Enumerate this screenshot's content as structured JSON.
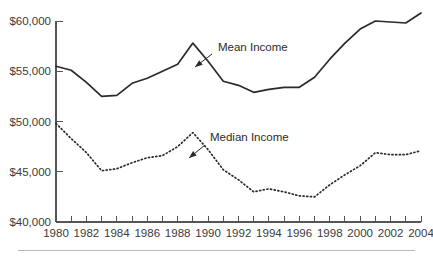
{
  "figure": {
    "name": "income-trend-chart",
    "background_color": "#ffffff",
    "line_color": "#2a2a2a",
    "axis_color": "#555555",
    "footer_rule_color": "#b9b9b9"
  },
  "chart_data": {
    "type": "line",
    "title": "",
    "subtitle": "",
    "xlabel": "",
    "ylabel": "",
    "xlim": [
      1980,
      2004
    ],
    "ylim": [
      40000,
      60000
    ],
    "grid": false,
    "legend_position": "inline-annotation",
    "x": [
      1980,
      1981,
      1982,
      1983,
      1984,
      1985,
      1986,
      1987,
      1988,
      1989,
      1990,
      1991,
      1992,
      1993,
      1994,
      1995,
      1996,
      1997,
      1998,
      1999,
      2000,
      2001,
      2002,
      2003,
      2004
    ],
    "x_tick_labels": [
      "1980",
      "",
      "1982",
      "",
      "1984",
      "",
      "1986",
      "",
      "1988",
      "",
      "1990",
      "",
      "1992",
      "",
      "1994",
      "",
      "1996",
      "",
      "1998",
      "",
      "2000",
      "",
      "2002",
      "",
      "2004"
    ],
    "y_tick_values": [
      40000,
      45000,
      50000,
      55000,
      60000
    ],
    "y_tick_labels": [
      "$40,000",
      "$45,000",
      "$50,000",
      "$55,000",
      "$60,000"
    ],
    "series": [
      {
        "name": "Mean Income",
        "style": "solid",
        "annotation": "Mean Income",
        "values": [
          55500,
          55100,
          53900,
          52500,
          52600,
          53800,
          54300,
          55000,
          55700,
          57800,
          56000,
          54000,
          53600,
          52900,
          53200,
          53400,
          53400,
          54400,
          56200,
          57800,
          59200,
          60000,
          59900,
          59800,
          60800
        ]
      },
      {
        "name": "Median Income",
        "style": "dotted",
        "annotation": "Median Income",
        "values": [
          49800,
          48300,
          46900,
          45100,
          45300,
          45900,
          46400,
          46600,
          47500,
          48900,
          47200,
          45200,
          44200,
          43000,
          43300,
          43000,
          42600,
          42500,
          43700,
          44700,
          45600,
          46900,
          46700,
          46700,
          47100
        ]
      }
    ],
    "annotations": [
      {
        "label": "Mean Income",
        "text_x": 218,
        "text_y": 51,
        "arrow_from_x": 212,
        "arrow_from_y": 54,
        "arrow_to_x": 195,
        "arrow_to_y": 67
      },
      {
        "label": "Median Income",
        "text_x": 210,
        "text_y": 141,
        "arrow_from_x": 205,
        "arrow_from_y": 145,
        "arrow_to_x": 189,
        "arrow_to_y": 158
      }
    ]
  },
  "axes": {
    "plot_left": 56,
    "plot_right": 421,
    "plot_top": 21,
    "plot_bottom": 222,
    "y_axis_label": "income-axis",
    "x_axis_label": "year-axis"
  }
}
